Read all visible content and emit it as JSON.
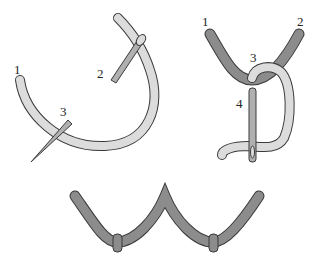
{
  "diagram": {
    "colors": {
      "light_thread": "#dcdcdc",
      "dark_thread": "#8c8c8c",
      "outline": "#3a3a3a",
      "needle": "#b0b0b0",
      "background": "#ffffff"
    },
    "panels": [
      {
        "name": "step-1",
        "labels": [
          "1",
          "2",
          "3"
        ]
      },
      {
        "name": "step-2",
        "labels": [
          "1",
          "2",
          "3",
          "4"
        ]
      },
      {
        "name": "finished-row",
        "labels": []
      }
    ]
  }
}
